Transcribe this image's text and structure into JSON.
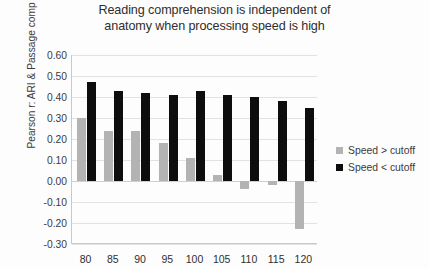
{
  "chart_data": {
    "type": "bar",
    "title": "Reading comprehension is independent of\nanatomy when processing speed is high",
    "xlabel": "",
    "ylabel": "Pearson r: ARI & Passage comp",
    "categories": [
      "80",
      "85",
      "90",
      "95",
      "100",
      "105",
      "110",
      "115",
      "120"
    ],
    "series": [
      {
        "name": "Speed > cutoff",
        "color": "#b3b3b3",
        "values": [
          0.3,
          0.24,
          0.24,
          0.18,
          0.11,
          0.03,
          -0.04,
          -0.02,
          -0.23
        ]
      },
      {
        "name": "Speed < cutoff",
        "color": "#0d0d0d",
        "values": [
          0.47,
          0.43,
          0.42,
          0.41,
          0.43,
          0.41,
          0.4,
          0.38,
          0.35
        ]
      }
    ],
    "ylim": [
      -0.3,
      0.6
    ],
    "ytick_step": 0.1,
    "ytick_labels": [
      "0.60",
      "0.50",
      "0.40",
      "0.30",
      "0.20",
      "0.10",
      "0.00",
      "-0.10",
      "-0.20",
      "-0.30"
    ],
    "ytick_values": [
      0.6,
      0.5,
      0.4,
      0.3,
      0.2,
      0.1,
      0.0,
      -0.1,
      -0.2,
      -0.3
    ],
    "grid": true,
    "legend_position": "right"
  }
}
